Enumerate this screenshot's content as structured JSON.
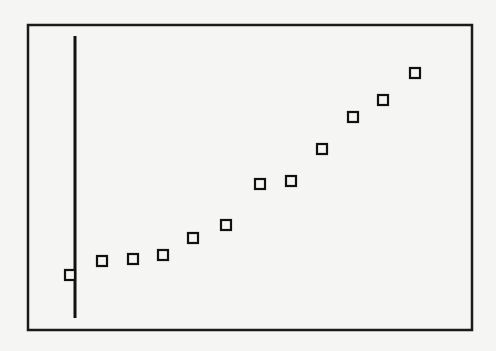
{
  "chart_data": {
    "type": "scatter",
    "title": "",
    "xlabel": "",
    "ylabel": "",
    "grid": false,
    "legend": null,
    "marker": "hollow-square",
    "colors": {
      "background": "#f5f5f3",
      "frame": "#1a1a1a",
      "axis": "#111111",
      "marker": "#111111"
    },
    "pixel_layout": {
      "frame": {
        "left": 28,
        "top": 25,
        "right": 472,
        "bottom": 330
      },
      "y_axis_line": {
        "x": 75,
        "y1": 36,
        "y2": 318
      }
    },
    "x": [
      1,
      2,
      3,
      4,
      5,
      6,
      7,
      8,
      9,
      10,
      11,
      12
    ],
    "y": [
      1.0,
      1.5,
      1.6,
      1.7,
      2.3,
      2.8,
      4.2,
      4.3,
      5.4,
      6.5,
      7.1,
      8.0
    ],
    "pixel_points": [
      [
        70,
        275
      ],
      [
        102,
        261
      ],
      [
        133,
        259
      ],
      [
        163,
        255
      ],
      [
        193,
        238
      ],
      [
        226,
        225
      ],
      [
        260,
        184
      ],
      [
        291,
        181
      ],
      [
        322,
        149
      ],
      [
        353,
        117
      ],
      [
        383,
        100
      ],
      [
        415,
        73
      ]
    ]
  }
}
